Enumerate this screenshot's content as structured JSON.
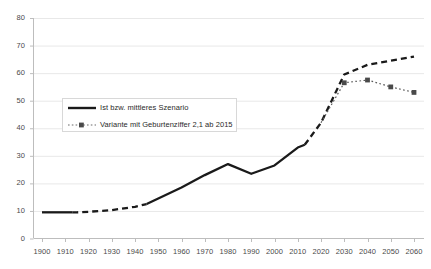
{
  "chart_data": {
    "type": "line",
    "title": "",
    "subtitle": "",
    "xlabel": "",
    "ylabel": "",
    "xlim": [
      1900,
      2060
    ],
    "ylim": [
      0,
      80
    ],
    "grid": true,
    "grid_axis": "y",
    "legend_position": "inside-left",
    "x_ticks": [
      1900,
      1910,
      1920,
      1930,
      1940,
      1950,
      1960,
      1970,
      1980,
      1990,
      2000,
      2010,
      2020,
      2030,
      2040,
      2050,
      2060
    ],
    "y_ticks": [
      0,
      10,
      20,
      30,
      40,
      50,
      60,
      70,
      80
    ],
    "series": [
      {
        "name": "Ist bzw. mittleres Szenario",
        "style": "solid-with-dashed-segments",
        "color": "#1a1a1a",
        "x": [
          1900,
          1910,
          1915,
          1920,
          1930,
          1940,
          1945,
          1950,
          1960,
          1970,
          1980,
          1990,
          2000,
          2010,
          2013,
          2020,
          2030,
          2040,
          2050,
          2060
        ],
        "values": [
          9.5,
          9.5,
          9.5,
          9.7,
          10.3,
          11.5,
          12.5,
          14.5,
          18.5,
          23.0,
          27.0,
          23.5,
          26.5,
          33.0,
          34.0,
          42.0,
          59.5,
          63.0,
          64.5,
          66.0
        ],
        "dashed_ranges": [
          [
            1913,
            1945
          ],
          [
            2013,
            2060
          ]
        ]
      },
      {
        "name": "Variante mit Geburtenziffer 2,1 ab 2015",
        "style": "dotted-with-square-markers",
        "color": "#5a5a5a",
        "x": [
          2020,
          2030,
          2040,
          2050,
          2060
        ],
        "values": [
          42.0,
          56.5,
          57.5,
          55.0,
          53.0
        ],
        "markers_at": [
          2030,
          2040,
          2050,
          2060
        ]
      }
    ]
  },
  "legend": {
    "items": [
      {
        "label": "Ist bzw. mittleres Szenario",
        "key": "solid-line-key"
      },
      {
        "label": "Variante mit Geburtenziffer 2,1 ab 2015",
        "key": "dotted-marker-line-key"
      }
    ]
  },
  "axes": {
    "y_tick_labels": [
      "80",
      "70",
      "60",
      "50",
      "40",
      "30",
      "20",
      "10",
      "0"
    ],
    "x_tick_labels": [
      "1900",
      "1910",
      "1920",
      "1930",
      "1940",
      "1950",
      "1960",
      "1970",
      "1980",
      "1990",
      "2000",
      "2010",
      "2020",
      "2030",
      "2040",
      "2050",
      "2060"
    ]
  },
  "colors": {
    "series_primary": "#1a1a1a",
    "series_secondary": "#5a5a5a",
    "grid": "#e8e8e8",
    "axis": "#bdbdbd",
    "tick_text": "#4a4a4a"
  }
}
